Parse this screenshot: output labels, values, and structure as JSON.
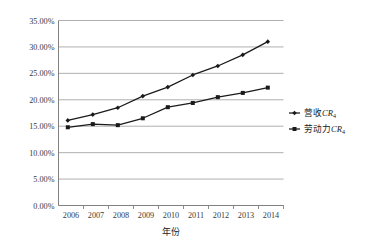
{
  "chart_data": {
    "type": "line",
    "title": "",
    "xlabel": "年份",
    "ylabel": "",
    "categories": [
      "2006",
      "2007",
      "2008",
      "2009",
      "2010",
      "2011",
      "2012",
      "2013",
      "2014"
    ],
    "series": [
      {
        "name": "营收CR4",
        "name_base": "营收",
        "name_italic": "CR",
        "name_sub": "4",
        "marker": "diamond",
        "color": "#1a1a1a",
        "values": [
          16.1,
          17.2,
          18.5,
          20.7,
          22.4,
          24.7,
          26.4,
          28.5,
          31.0
        ]
      },
      {
        "name": "劳动力CR4",
        "name_base": "劳动力",
        "name_italic": "CR",
        "name_sub": "4",
        "marker": "square",
        "color": "#1a1a1a",
        "values": [
          14.8,
          15.4,
          15.2,
          16.5,
          18.6,
          19.4,
          20.5,
          21.3,
          22.3
        ]
      }
    ],
    "ylim": [
      0,
      35
    ],
    "ytick_step": 5,
    "ytick_labels": [
      "0.00%",
      "5.00%",
      "10.00%",
      "15.00%",
      "20.00%",
      "25.00%",
      "30.00%",
      "35.00%"
    ],
    "ytick_values": [
      0,
      5,
      10,
      15,
      20,
      25,
      30,
      35
    ],
    "grid": true,
    "grid_axis": "y",
    "legend_position": "right",
    "gridline_color": "#a6a6a6",
    "axis_color": "#808080",
    "background": "#ffffff"
  }
}
